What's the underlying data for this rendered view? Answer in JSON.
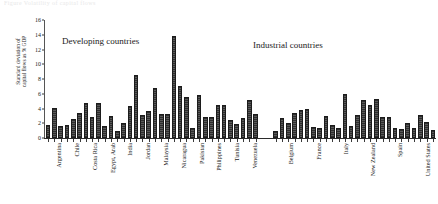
{
  "figure": {
    "caption_ghost": "Figure  Volatility of capital flows",
    "group_labels": {
      "developing": "Developing countries",
      "industrial": "Industrial countries"
    }
  },
  "chart_data": {
    "type": "bar",
    "title": "",
    "subtitle": "",
    "xlabel": "",
    "ylabel": "Standard deviation of\ncapital flows as % GDP",
    "ylim": [
      0,
      16
    ],
    "yticks": [
      0,
      2,
      4,
      6,
      8,
      10,
      12,
      14,
      16
    ],
    "ytick_labels": [
      "0",
      "2",
      "4",
      "6",
      "8",
      "10",
      "12",
      "14",
      "16"
    ],
    "grid": false,
    "legend": "none",
    "annotations": [
      "Developing countries",
      "Industrial countries"
    ],
    "groups": [
      {
        "name": "Developing countries",
        "tick_labels": [
          "Argentina",
          "Chile",
          "Costa Rica",
          "Egypt, Arab",
          "India",
          "Jordan",
          "Malaysia",
          "Nicaragua",
          "Pakistan",
          "Philippines",
          "Tunisia",
          "Venezuela"
        ],
        "values": [
          1.8,
          4.1,
          1.6,
          1.7,
          2.6,
          3.4,
          4.8,
          2.9,
          4.7,
          1.6,
          3.0,
          1.0,
          2.1,
          4.4,
          8.6,
          3.1,
          3.7,
          6.8,
          3.2,
          3.2,
          13.9,
          7.0,
          5.6,
          1.4,
          5.9,
          2.9,
          2.9,
          4.5,
          4.5,
          2.4,
          1.9,
          2.7,
          5.2,
          3.3
        ]
      },
      {
        "name": "Industrial countries",
        "tick_labels": [
          "Belgium",
          "France",
          "Italy",
          "New Zealand",
          "Spain",
          "United States"
        ],
        "values": [
          1.0,
          2.7,
          2.0,
          3.4,
          3.8,
          3.9,
          1.5,
          1.3,
          3.0,
          1.8,
          1.4,
          6.0,
          1.6,
          3.1,
          5.1,
          4.5,
          5.3,
          2.9,
          2.8,
          1.3,
          1.2,
          2.0,
          1.4,
          3.1,
          2.2,
          1.1
        ]
      }
    ]
  },
  "colors": {
    "bar_dark": "#2e2e2e",
    "bar_light": "#5a5a5a",
    "axis": "#2b2b2b",
    "background": "#ffffff",
    "text": "#1a1a1a"
  }
}
